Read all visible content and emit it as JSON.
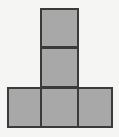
{
  "figure": {
    "title": "Polyomino figure",
    "shape_name": "T-pentomino",
    "square_count": "5",
    "colors": {
      "background": "#f5f5f3",
      "square_fill": "#a8a8a8",
      "square_border": "#3a3a3a"
    },
    "canvas": {
      "width": "119",
      "height": "137"
    },
    "squares": [
      {
        "id": "top",
        "label": "Top square",
        "grid_row": "1",
        "grid_column": "2"
      },
      {
        "id": "middle",
        "label": "Middle square",
        "grid_row": "2",
        "grid_column": "2"
      },
      {
        "id": "base-left",
        "label": "Bottom-left square",
        "grid_row": "3",
        "grid_column": "1"
      },
      {
        "id": "base-center",
        "label": "Bottom-center square",
        "grid_row": "3",
        "grid_column": "2"
      },
      {
        "id": "base-right",
        "label": "Bottom-right square",
        "grid_row": "3",
        "grid_column": "3"
      }
    ]
  }
}
